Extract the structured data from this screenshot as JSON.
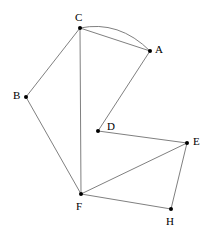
{
  "diagram": {
    "background_color": "#ffffff",
    "edge_color": "#808080",
    "node_color": "#000000",
    "label_color": "#000000",
    "node_radius": 2,
    "edge_width": 1,
    "width": 209,
    "height": 239,
    "nodes": [
      {
        "id": "A",
        "label": "A",
        "x": 150,
        "y": 51,
        "label_x": 155,
        "label_y": 44
      },
      {
        "id": "B",
        "label": "B",
        "x": 26,
        "y": 97,
        "label_x": 13,
        "label_y": 90
      },
      {
        "id": "C",
        "label": "C",
        "x": 80,
        "y": 28,
        "label_x": 75,
        "label_y": 12
      },
      {
        "id": "D",
        "label": "D",
        "x": 98,
        "y": 131,
        "label_x": 107,
        "label_y": 121
      },
      {
        "id": "E",
        "label": "E",
        "x": 187,
        "y": 143,
        "label_x": 193,
        "label_y": 136
      },
      {
        "id": "F",
        "label": "F",
        "x": 81,
        "y": 194,
        "label_x": 76,
        "label_y": 201
      },
      {
        "id": "H",
        "label": "H",
        "x": 171,
        "y": 209,
        "label_x": 166,
        "label_y": 216
      }
    ],
    "edges": [
      {
        "from": "C",
        "to": "A",
        "type": "line",
        "name": "edge-c-a-straight"
      },
      {
        "from": "C",
        "to": "A",
        "type": "curve",
        "name": "edge-c-a-curved",
        "control_x": 119,
        "control_y": 20
      },
      {
        "from": "C",
        "to": "B",
        "type": "line",
        "name": "edge-c-b"
      },
      {
        "from": "C",
        "to": "F",
        "type": "line",
        "name": "edge-c-f"
      },
      {
        "from": "B",
        "to": "F",
        "type": "line",
        "name": "edge-b-f"
      },
      {
        "from": "A",
        "to": "D",
        "type": "line",
        "name": "edge-a-d"
      },
      {
        "from": "D",
        "to": "E",
        "type": "line",
        "name": "edge-d-e"
      },
      {
        "from": "F",
        "to": "E",
        "type": "line",
        "name": "edge-f-e"
      },
      {
        "from": "F",
        "to": "H",
        "type": "line",
        "name": "edge-f-h"
      },
      {
        "from": "E",
        "to": "H",
        "type": "line",
        "name": "edge-e-h"
      }
    ]
  }
}
